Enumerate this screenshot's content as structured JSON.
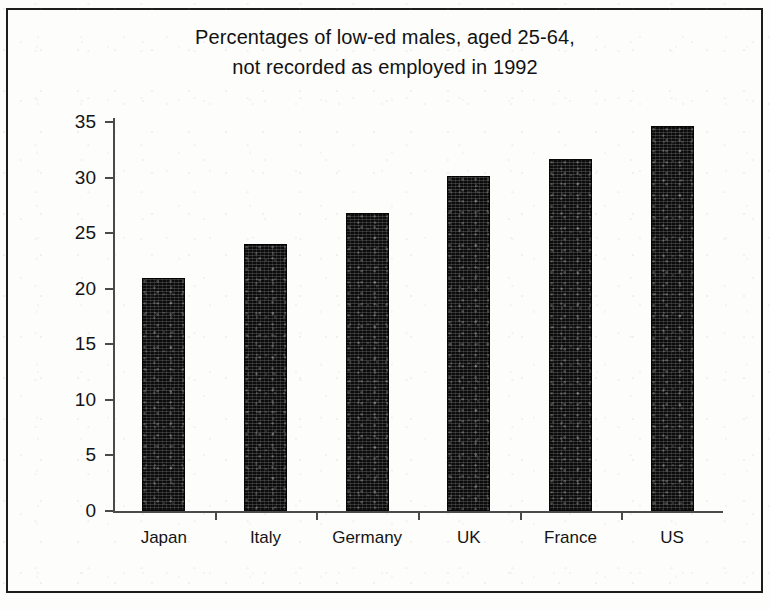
{
  "chart_data": {
    "type": "bar",
    "title": "Percentages of low-ed males, aged 25-64, not recorded as employed in 1992",
    "title_lines": [
      "Percentages of low-ed males, aged 25-64,",
      "not recorded as employed in 1992"
    ],
    "categories": [
      "Japan",
      "Italy",
      "Germany",
      "UK",
      "France",
      "US"
    ],
    "values": [
      21.0,
      24.0,
      26.8,
      30.1,
      31.7,
      34.6
    ],
    "xlabel": "",
    "ylabel": "",
    "ylim": [
      0,
      37
    ],
    "yticks": [
      0,
      5,
      10,
      15,
      20,
      25,
      30,
      35
    ],
    "ytick_labels": [
      "0",
      "5",
      "10",
      "15",
      "20",
      "25",
      "30",
      "35"
    ],
    "grid": false,
    "legend": false,
    "bar_color": "#0c0c0c",
    "background_color": "#fdfdfb",
    "axis_color": "#4a4a4a"
  }
}
